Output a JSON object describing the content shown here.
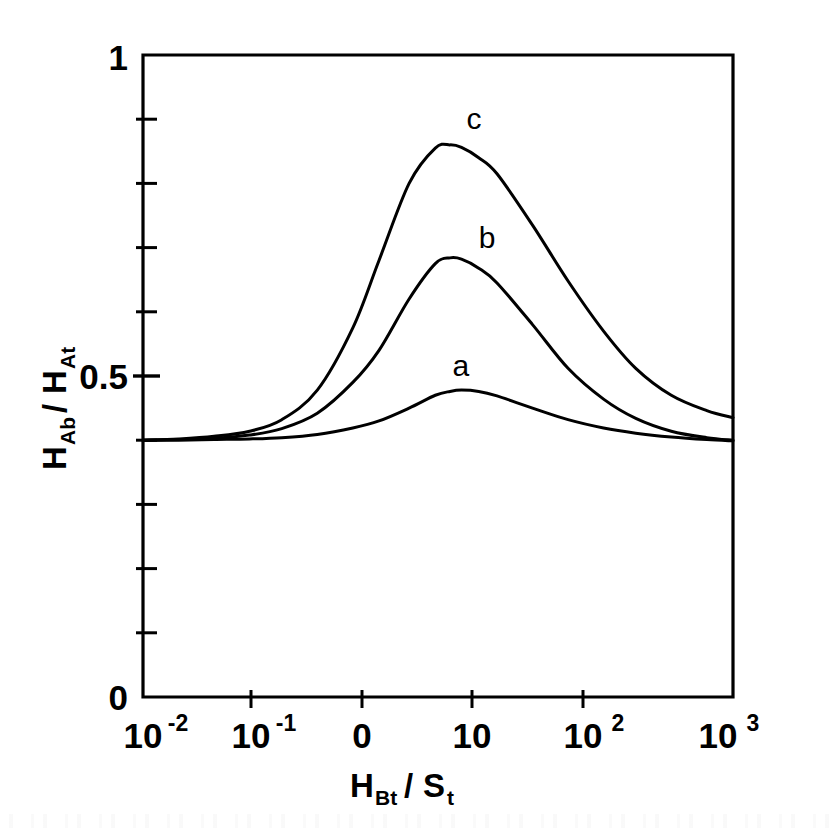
{
  "figure": {
    "background_color": "#ffffff",
    "line_color": "#000000"
  },
  "chart_data": {
    "type": "line",
    "title": "",
    "subtitle": "",
    "xlabel": "H_Bt / S_t",
    "xlabel_main": "H",
    "xlabel_main_sub": "Bt",
    "xlabel_divider": "/",
    "xlabel_second": "S",
    "xlabel_second_sub": "t",
    "ylabel": "H_Ab / H_At",
    "ylabel_main": "H",
    "ylabel_main_sub": "Ab",
    "ylabel_divider": "/",
    "ylabel_second": "H",
    "ylabel_second_sub": "At",
    "xscale": "log",
    "xlim": [
      0.01,
      1000
    ],
    "ylim": [
      0,
      1
    ],
    "grid": false,
    "legend_position": "inline-annotations",
    "x_tick_labels": [
      "10-2",
      "10-1",
      "0",
      "10",
      "102",
      "103"
    ],
    "x_ticks": [
      {
        "base": "10",
        "exp": "-2",
        "value": 0.01
      },
      {
        "base": "10",
        "exp": "-1",
        "value": 0.1
      },
      {
        "base": "0",
        "exp": "",
        "value": 1
      },
      {
        "base": "10",
        "exp": "",
        "value": 10
      },
      {
        "base": "10",
        "exp": "2",
        "value": 100
      },
      {
        "base": "10",
        "exp": "3",
        "value": 1000
      }
    ],
    "y_tick_labels": [
      "0",
      "0.5",
      "1"
    ],
    "y_ticks_labeled": [
      0,
      0.5,
      1
    ],
    "y_ticks_minor": [
      0.1,
      0.2,
      0.3,
      0.4,
      0.6,
      0.7,
      0.8,
      0.9
    ],
    "annotations": [
      {
        "text": "a",
        "x": 4.2,
        "y": 0.5
      },
      {
        "text": "b",
        "x": 7.0,
        "y": 0.7
      },
      {
        "text": "c",
        "x": 5.5,
        "y": 0.885
      }
    ],
    "series": [
      {
        "name": "a",
        "label": "a",
        "x": [
          0.01,
          0.02,
          0.04,
          0.08,
          0.15,
          0.3,
          0.6,
          1.0,
          1.8,
          3.0,
          4.0,
          5.0,
          7.0,
          10,
          20,
          40,
          80,
          150,
          300,
          600,
          1000
        ],
        "values": [
          0.4,
          0.4,
          0.401,
          0.402,
          0.404,
          0.409,
          0.419,
          0.43,
          0.45,
          0.47,
          0.476,
          0.478,
          0.476,
          0.469,
          0.45,
          0.432,
          0.419,
          0.411,
          0.405,
          0.401,
          0.399
        ]
      },
      {
        "name": "b",
        "label": "b",
        "x": [
          0.01,
          0.02,
          0.04,
          0.08,
          0.15,
          0.3,
          0.6,
          1.0,
          1.8,
          3.0,
          4.0,
          5.0,
          7.0,
          10,
          20,
          40,
          80,
          150,
          300,
          600,
          1000
        ],
        "values": [
          0.4,
          0.401,
          0.403,
          0.408,
          0.418,
          0.442,
          0.49,
          0.54,
          0.62,
          0.675,
          0.684,
          0.682,
          0.668,
          0.645,
          0.58,
          0.512,
          0.464,
          0.434,
          0.414,
          0.404,
          0.4
        ]
      },
      {
        "name": "c",
        "label": "c",
        "x": [
          0.01,
          0.02,
          0.04,
          0.08,
          0.15,
          0.3,
          0.6,
          1.0,
          1.8,
          3.0,
          4.0,
          5.0,
          7.0,
          10,
          20,
          40,
          80,
          150,
          300,
          600,
          1000
        ],
        "values": [
          0.4,
          0.402,
          0.406,
          0.414,
          0.432,
          0.478,
          0.575,
          0.68,
          0.8,
          0.855,
          0.86,
          0.856,
          0.84,
          0.815,
          0.735,
          0.648,
          0.57,
          0.512,
          0.47,
          0.446,
          0.435
        ]
      }
    ]
  }
}
